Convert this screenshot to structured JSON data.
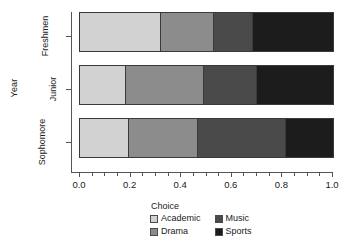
{
  "chart_data": {
    "type": "bar",
    "orientation": "horizontal",
    "stacked": true,
    "normalized": true,
    "title": "",
    "xlabel": "",
    "ylabel": "Year",
    "legend_title": "Choice",
    "legend_position": "bottom",
    "grid": false,
    "xlim": [
      0.0,
      1.0
    ],
    "xticks": [
      0.0,
      0.2,
      0.4,
      0.6,
      0.8,
      1.0
    ],
    "xtick_labels": [
      "0.0",
      "0.2",
      "0.4",
      "0.6",
      "0.8",
      "1.0"
    ],
    "categories": [
      "Freshmen",
      "Junior",
      "Sophomore"
    ],
    "series": [
      {
        "name": "Academic",
        "color": "#d2d2d2",
        "values": [
          0.32,
          0.18,
          0.195
        ]
      },
      {
        "name": "Drama",
        "color": "#8c8c8c",
        "values": [
          0.21,
          0.31,
          0.27
        ]
      },
      {
        "name": "Music",
        "color": "#4a4a4a",
        "values": [
          0.155,
          0.21,
          0.35
        ]
      },
      {
        "name": "Sports",
        "color": "#1c1c1c",
        "values": [
          0.315,
          0.3,
          0.185
        ]
      }
    ]
  },
  "axis": {
    "y_title": "Year",
    "y_categories": [
      "Freshmen",
      "Junior",
      "Sophomore"
    ],
    "x_tick_labels": [
      "0.0",
      "0.2",
      "0.4",
      "0.6",
      "0.8",
      "1.0"
    ]
  },
  "legend": {
    "title": "Choice",
    "column_left": [
      {
        "label": "Academic",
        "color": "#d2d2d2"
      },
      {
        "label": "Drama",
        "color": "#8c8c8c"
      }
    ],
    "column_right": [
      {
        "label": "Music",
        "color": "#4a4a4a"
      },
      {
        "label": "Sports",
        "color": "#1c1c1c"
      }
    ]
  }
}
